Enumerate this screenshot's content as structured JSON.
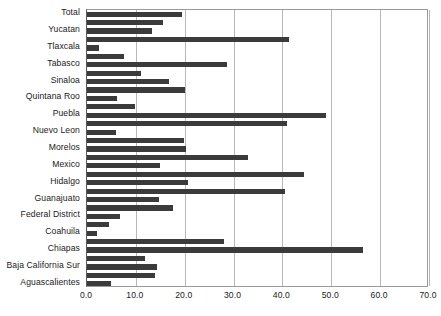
{
  "chart_data": {
    "type": "bar",
    "orientation": "horizontal",
    "title": "",
    "subtitle": "",
    "xlabel": "",
    "ylabel": "",
    "xlim": [
      0.0,
      70.0
    ],
    "xticks": [
      "0.0",
      "10.0",
      "20.0",
      "30.0",
      "40.0",
      "50.0",
      "60.0",
      "70.0"
    ],
    "xtick_values": [
      0,
      10,
      20,
      30,
      40,
      50,
      60,
      70
    ],
    "grid": "vertical",
    "legend": "none",
    "bar_color": "#3b3b3b",
    "series_name": "value",
    "categories": [
      "Total",
      "",
      "Yucatan",
      "",
      "Tlaxcala",
      "",
      "Tabasco",
      "",
      "Sinaloa",
      "",
      "Quintana Roo",
      "",
      "Puebla",
      "",
      "Nuevo Leon",
      "",
      "Morelos",
      "",
      "Mexico",
      "",
      "Hidalgo",
      "",
      "Guanajuato",
      "",
      "Federal District",
      "",
      "Coahuila",
      "",
      "Chiapas",
      "",
      "Baja California Sur",
      "",
      "Aguascalientes"
    ],
    "labeled_categories": [
      "Total",
      "Yucatan",
      "Tlaxcala",
      "Tabasco",
      "Sinaloa",
      "Quintana Roo",
      "Puebla",
      "Nuevo Leon",
      "Morelos",
      "Mexico",
      "Hidalgo",
      "Guanajuato",
      "Federal District",
      "Coahuila",
      "Chiapas",
      "Baja California Sur",
      "Aguascalientes"
    ],
    "values": [
      19.4,
      15.5,
      13.3,
      41.3,
      2.4,
      7.5,
      28.6,
      11.0,
      16.7,
      20.0,
      6.2,
      9.8,
      49.0,
      41.0,
      6.0,
      19.8,
      20.2,
      33.0,
      15.0,
      44.5,
      20.6,
      40.5,
      14.8,
      17.5,
      6.8,
      4.6,
      2.0,
      28.0,
      56.5,
      11.8,
      14.4,
      13.9,
      4.9
    ]
  }
}
